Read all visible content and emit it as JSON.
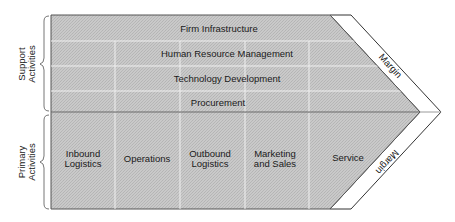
{
  "colors": {
    "fill": "#c8c8c8",
    "fill_dither": "#b6b6b6",
    "divider": "#f2f2f2",
    "border": "#555555",
    "margin_fill": "#ffffff",
    "text": "#1a1a1a"
  },
  "groups": {
    "support": {
      "line1": "Support",
      "line2": "Activities"
    },
    "primary": {
      "line1": "Primary",
      "line2": "Activities"
    }
  },
  "support_activities": [
    {
      "label": "Firm Infrastructure"
    },
    {
      "label": "Human Resource Management"
    },
    {
      "label": "Technology Development"
    },
    {
      "label": "Procurement"
    }
  ],
  "primary_activities": [
    {
      "line1": "Inbound",
      "line2": "Logistics"
    },
    {
      "line1": "Operations",
      "line2": ""
    },
    {
      "line1": "Outbound",
      "line2": "Logistics"
    },
    {
      "line1": "Marketing",
      "line2": "and Sales"
    },
    {
      "line1": "Service",
      "line2": ""
    }
  ],
  "margin": {
    "top_label": "Margin",
    "bottom_label": "Margin"
  }
}
